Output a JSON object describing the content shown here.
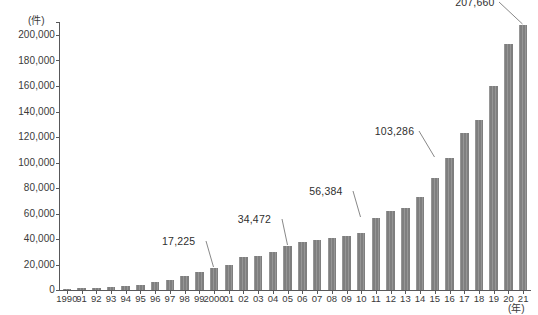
{
  "chart_data": {
    "type": "bar",
    "title": "",
    "xlabel": "(年)",
    "ylabel": "(件)",
    "ylim": [
      0,
      210000
    ],
    "ytick_values": [
      0,
      20000,
      40000,
      60000,
      80000,
      100000,
      120000,
      140000,
      160000,
      180000,
      200000
    ],
    "ytick_labels": [
      "0",
      "20,000",
      "40,000",
      "60,000",
      "80,000",
      "100,000",
      "120,000",
      "140,000",
      "160,000",
      "180,000",
      "200,000"
    ],
    "grid": false,
    "legend": null,
    "bar_color": "#7f7f7f",
    "axis_color": "#58585a",
    "categories": [
      "1990",
      "91",
      "92",
      "93",
      "94",
      "95",
      "96",
      "97",
      "98",
      "99",
      "2000",
      "01",
      "02",
      "03",
      "04",
      "05",
      "06",
      "07",
      "08",
      "09",
      "10",
      "11",
      "12",
      "13",
      "14",
      "15",
      "16",
      "17",
      "18",
      "19",
      "20",
      "21"
    ],
    "values": [
      1000,
      1200,
      1600,
      2100,
      2900,
      4100,
      6100,
      8200,
      11200,
      14100,
      17225,
      19700,
      25500,
      26300,
      29600,
      34472,
      37500,
      39600,
      40400,
      42500,
      44800,
      56384,
      61800,
      64500,
      73200,
      88200,
      103286,
      123500,
      133700,
      159800,
      193100,
      207660
    ],
    "annotations": [
      {
        "category": "2000",
        "index": 10,
        "label": "17,225",
        "value": 17225
      },
      {
        "category": "05",
        "index": 15,
        "label": "34,472",
        "value": 34472
      },
      {
        "category": "10",
        "index": 20,
        "label": "56,384",
        "value": 56384
      },
      {
        "category": "15",
        "index": 25,
        "label": "103,286",
        "value": 103286
      },
      {
        "category": "21",
        "index": 31,
        "label": "207,660",
        "value": 207660
      }
    ]
  }
}
